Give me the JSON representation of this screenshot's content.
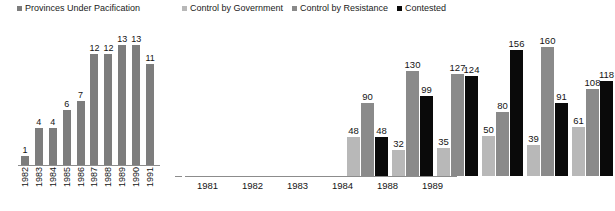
{
  "chart_data": [
    {
      "type": "bar",
      "title": "Provinces Under Pacification",
      "xlabel": "",
      "ylabel": "",
      "legend_position": "top",
      "grid": false,
      "ylim": [
        0,
        14
      ],
      "legend": [
        {
          "label": "Provinces Under Pacification",
          "color": "#7d7d7d"
        }
      ],
      "categories": [
        "1982",
        "1983",
        "1984",
        "1985",
        "1986",
        "1987",
        "1988",
        "1989",
        "1990",
        "1991"
      ],
      "series": [
        {
          "name": "Provinces Under Pacification",
          "color": "#7d7d7d",
          "values": [
            1,
            4,
            4,
            6,
            7,
            12,
            12,
            13,
            13,
            11
          ]
        }
      ]
    },
    {
      "type": "bar",
      "title": "",
      "xlabel": "",
      "ylabel": "",
      "legend_position": "top",
      "grid": false,
      "ylim": [
        0,
        170
      ],
      "legend": [
        {
          "label": "Control by Government",
          "color": "#b8b8b8"
        },
        {
          "label": "Control by Resistance",
          "color": "#8a8a8a"
        },
        {
          "label": "Contested",
          "color": "#0a0a0a"
        }
      ],
      "categories": [
        "1981",
        "1982",
        "1983",
        "1984",
        "1988",
        "1989"
      ],
      "series": [
        {
          "name": "Control by Government",
          "color": "#b8b8b8",
          "values": [
            48,
            32,
            35,
            50,
            39,
            61
          ]
        },
        {
          "name": "Control by Resistance",
          "color": "#8a8a8a",
          "values": [
            90,
            130,
            127,
            80,
            160,
            108
          ]
        },
        {
          "name": "Contested",
          "color": "#0a0a0a",
          "values": [
            48,
            99,
            124,
            156,
            91,
            118
          ]
        }
      ]
    }
  ]
}
